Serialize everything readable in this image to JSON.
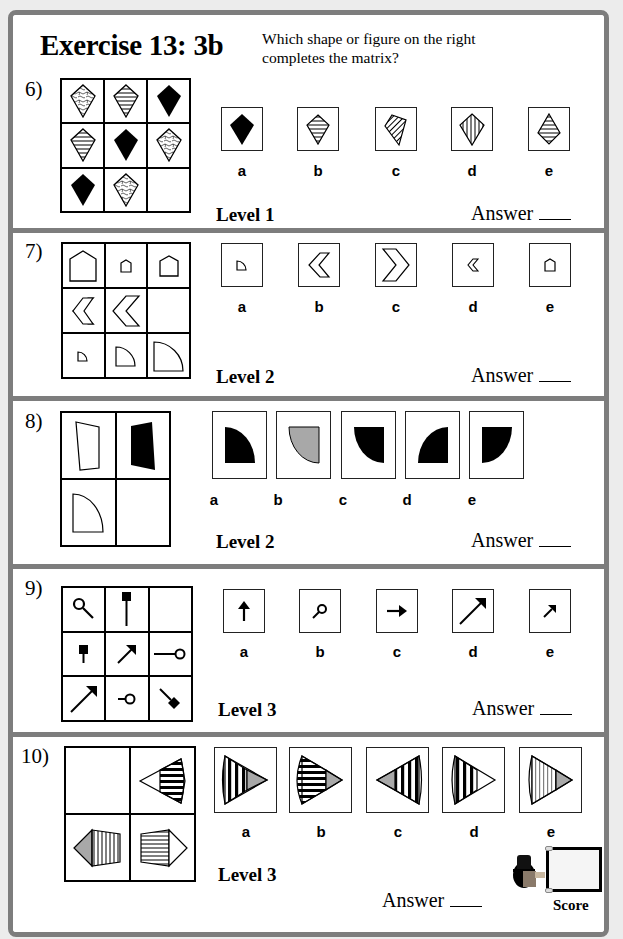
{
  "header": {
    "title": "Exercise 13: 3b",
    "instruction": "Which shape or figure on the right completes the matrix?"
  },
  "answer_label": "Answer",
  "score_label": "Score",
  "option_letters": [
    "a",
    "b",
    "c",
    "d",
    "e"
  ],
  "questions": [
    {
      "number": "6)",
      "level": "Level 1",
      "matrix": "3x3 kites: row1 squiggle, horizontal-striped, black; row2 horizontal-striped, black, squiggle; row3 black, squiggle, empty",
      "options": [
        {
          "letter": "a",
          "desc": "black kite"
        },
        {
          "letter": "b",
          "desc": "horizontal-striped kite"
        },
        {
          "letter": "c",
          "desc": "diagonal-striped tilted kite"
        },
        {
          "letter": "d",
          "desc": "vertical-striped kite"
        },
        {
          "letter": "e",
          "desc": "horizontal-striped inverted kite"
        }
      ]
    },
    {
      "number": "7)",
      "level": "Level 2",
      "matrix": "3x3: row1 house large, small, medium; row2 chevron medium, large, empty; row3 quarter-circle small, medium, large",
      "options": [
        {
          "letter": "a",
          "desc": "small quarter circle"
        },
        {
          "letter": "b",
          "desc": "medium left chevron"
        },
        {
          "letter": "c",
          "desc": "large right chevron"
        },
        {
          "letter": "d",
          "desc": "small left chevron"
        },
        {
          "letter": "e",
          "desc": "small house"
        }
      ]
    },
    {
      "number": "8)",
      "level": "Level 2",
      "matrix": "2x2: white trapezoid, black trapezoid; white quarter circle, empty",
      "options": [
        {
          "letter": "a",
          "desc": "black quarter circle arc top-right"
        },
        {
          "letter": "b",
          "desc": "grey quarter circle arc bottom-left"
        },
        {
          "letter": "c",
          "desc": "black quarter circle arc bottom-left"
        },
        {
          "letter": "d",
          "desc": "black quarter circle arc top-left"
        },
        {
          "letter": "e",
          "desc": "black segment"
        }
      ]
    },
    {
      "number": "9)",
      "level": "Level 3",
      "matrix": "3x3: magnifier, tall post, empty; short post, medium arrow, long pin; long arrow, short pin, diamond pin",
      "options": [
        {
          "letter": "a",
          "desc": "up arrow"
        },
        {
          "letter": "b",
          "desc": "small magnifier"
        },
        {
          "letter": "c",
          "desc": "right arrow"
        },
        {
          "letter": "d",
          "desc": "long diagonal arrow"
        },
        {
          "letter": "e",
          "desc": "short diagonal arrow"
        }
      ]
    },
    {
      "number": "10)",
      "level": "Level 3",
      "matrix": "2x2: empty, cone left with horizontal stripes; pentagon grey tip with vertical stripes, pentagon horizontal stripes",
      "options": [
        {
          "letter": "a",
          "desc": "cone right, thick vertical stripes, grey tip"
        },
        {
          "letter": "b",
          "desc": "cone right, horizontal stripes, grey tip"
        },
        {
          "letter": "c",
          "desc": "cone left, vertical stripes, grey tip"
        },
        {
          "letter": "d",
          "desc": "cone right, vertical stripes, white tip"
        },
        {
          "letter": "e",
          "desc": "cone right, thin vertical stripes, grey tip"
        }
      ]
    }
  ],
  "colors": {
    "frame": "#7d7d7d",
    "background": "#ececec",
    "grey_fill": "#a8a8a8"
  }
}
